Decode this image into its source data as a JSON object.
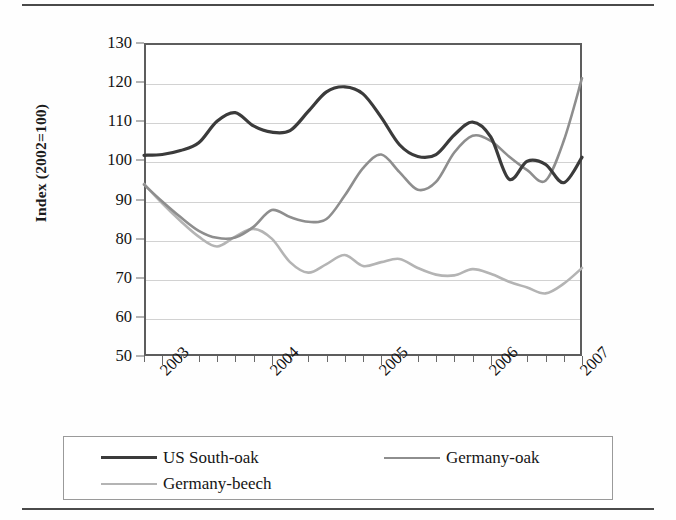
{
  "figure": {
    "type": "line-chart-figure",
    "background": "#fefefe"
  },
  "axes": {
    "y_title": "Index (2002=100)",
    "y_ticks": [
      "130",
      "120",
      "110",
      "100",
      "90",
      "80",
      "70",
      "60",
      "50"
    ],
    "x_ticks": [
      "2003",
      "2004",
      "2005",
      "2006",
      "2007"
    ]
  },
  "legend": {
    "items": [
      {
        "label": "US South-oak",
        "color": "#3b3b3b",
        "width": "3.2"
      },
      {
        "label": "Germany-oak",
        "color": "#8e8e8e",
        "width": "2.6"
      },
      {
        "label": "Germany-beech",
        "color": "#b4b4b4",
        "width": "2.6"
      }
    ]
  },
  "chart_data": {
    "type": "line",
    "title": "",
    "xlabel": "",
    "ylabel": "Index (2002=100)",
    "ylim": [
      50,
      130
    ],
    "yticks": [
      50,
      60,
      70,
      80,
      90,
      100,
      110,
      120,
      130
    ],
    "xlim": [
      "2002-10",
      "2006-10"
    ],
    "xticks": [
      "2003",
      "2004",
      "2005",
      "2006",
      "2007"
    ],
    "grid": "horizontal",
    "legend_position": "bottom",
    "x": [
      "2002-10",
      "2002-12",
      "2003-02",
      "2003-04",
      "2003-06",
      "2003-08",
      "2003-10",
      "2003-12",
      "2004-02",
      "2004-04",
      "2004-06",
      "2004-08",
      "2004-10",
      "2004-12",
      "2005-02",
      "2005-04",
      "2005-06",
      "2005-08",
      "2005-10",
      "2005-12",
      "2006-02",
      "2006-04",
      "2006-06",
      "2006-08",
      "2006-10"
    ],
    "series": [
      {
        "name": "US South-oak",
        "color": "#3b3b3b",
        "values": [
          101.3,
          101.5,
          102.5,
          104.5,
          110.0,
          112.2,
          108.8,
          107.2,
          107.6,
          112.5,
          117.5,
          118.8,
          117.0,
          111.0,
          104.0,
          101.0,
          101.5,
          106.5,
          109.8,
          106.0,
          95.2,
          99.8,
          99.0,
          94.3,
          100.8
        ]
      },
      {
        "name": "Germany-oak",
        "color": "#8e8e8e",
        "values": [
          93.8,
          89.5,
          85.5,
          82.0,
          80.2,
          80.3,
          83.0,
          87.3,
          85.5,
          84.3,
          85.0,
          91.0,
          98.0,
          101.5,
          97.0,
          92.5,
          94.5,
          102.0,
          106.3,
          105.0,
          101.0,
          97.5,
          94.8,
          105.0,
          121.0
        ]
      },
      {
        "name": "Germany-beech",
        "color": "#b4b4b4",
        "values": [
          94.0,
          89.0,
          84.5,
          80.5,
          78.0,
          80.5,
          82.5,
          80.0,
          74.0,
          71.3,
          73.5,
          75.8,
          73.0,
          74.0,
          74.8,
          72.5,
          70.8,
          70.6,
          72.2,
          71.0,
          69.0,
          67.5,
          66.0,
          68.5,
          72.5
        ]
      }
    ]
  }
}
